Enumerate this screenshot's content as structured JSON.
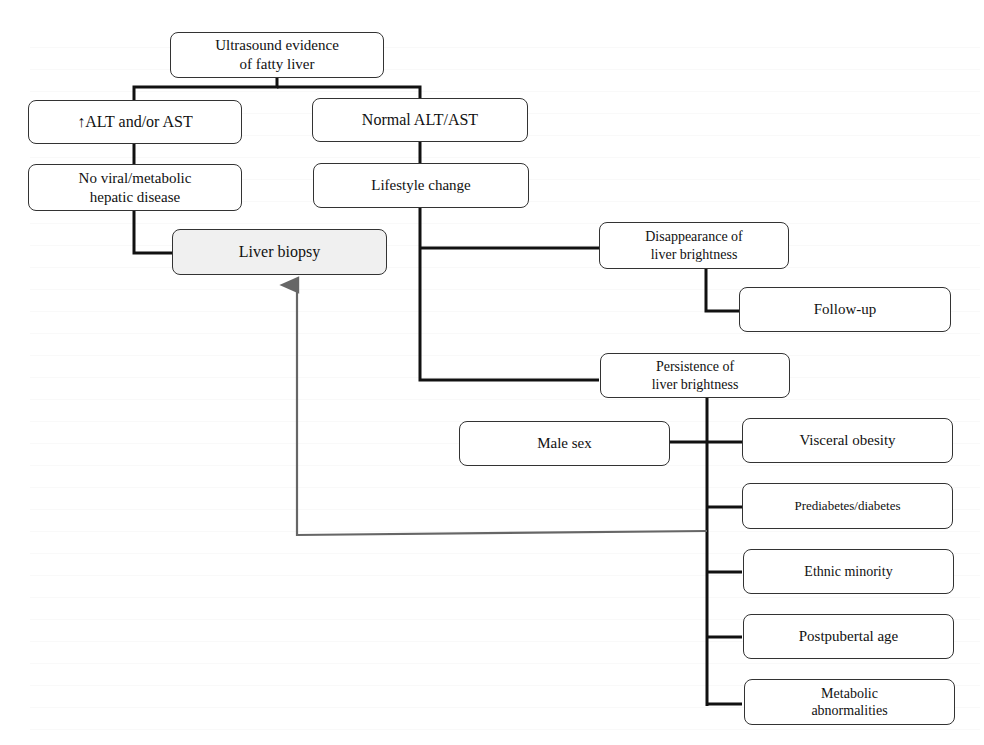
{
  "diagram": {
    "nodes": {
      "ultrasound": "Ultrasound evidence\nof fatty liver",
      "elevated": "↑ALT and/or AST",
      "normal": "Normal ALT/AST",
      "no_viral": "No viral/metabolic\nhepatic disease",
      "lifestyle": "Lifestyle change",
      "biopsy": "Liver biopsy",
      "disappearance": "Disappearance of\nliver brightness",
      "followup": "Follow-up",
      "persistence": "Persistence of\nliver brightness",
      "male": "Male sex",
      "visceral": "Visceral obesity",
      "prediabetes": "Prediabetes/diabetes",
      "ethnic": "Ethnic minority",
      "postpubertal": "Postpubertal age",
      "metabolic": "Metabolic\nabnormalities"
    },
    "colors": {
      "line": "#111111",
      "arrow": "#666666",
      "biopsy_fill": "#f0f0f0"
    }
  }
}
